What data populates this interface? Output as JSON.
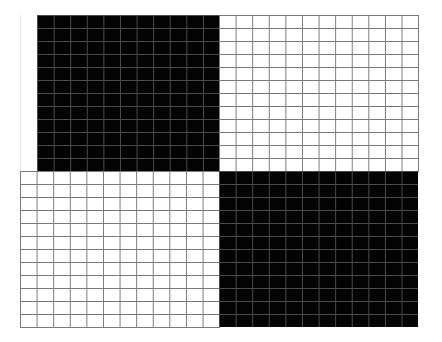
{
  "figure": {
    "colors": {
      "background": "#ffffff",
      "black_fill": "#030303",
      "grid_line_on_white": "#7a7a7a",
      "grid_line_on_black": "#4a4a4a"
    },
    "grid": {
      "columns_per_quadrant": 12,
      "rows_per_quadrant": 12,
      "cell_width_px": 16.6,
      "cell_height_px": 13
    },
    "quadrants": [
      {
        "position": "top-left",
        "fill": "black"
      },
      {
        "position": "top-right",
        "fill": "white"
      },
      {
        "position": "bottom-left",
        "fill": "white"
      },
      {
        "position": "bottom-right",
        "fill": "black"
      }
    ]
  }
}
